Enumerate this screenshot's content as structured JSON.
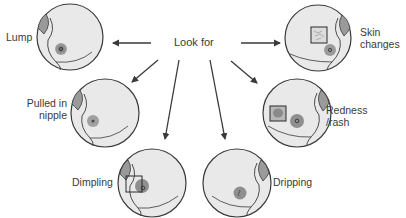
{
  "diagram": {
    "center_label": "Look for",
    "colors": {
      "circle_fill": "#e9e9e9",
      "outline": "#3a3a3a",
      "areola": "#8f8f8f",
      "lump": "#9a9a9a",
      "text": "#3a3a3a"
    },
    "signs": [
      {
        "id": "lump",
        "label": "Lump",
        "position": "top-left"
      },
      {
        "id": "skin-changes",
        "label_line1": "Skin",
        "label_line2": "changes",
        "position": "top-right"
      },
      {
        "id": "pulled-in-nipple",
        "label_line1": "Pulled in",
        "label_line2": "nipple",
        "position": "middle-left"
      },
      {
        "id": "redness-rash",
        "label_line1": "Redness",
        "label_line2": "/rash",
        "position": "middle-right"
      },
      {
        "id": "dimpling",
        "label": "Dimpling",
        "position": "bottom-left"
      },
      {
        "id": "dripping",
        "label": "Dripping",
        "position": "bottom-right"
      }
    ]
  }
}
